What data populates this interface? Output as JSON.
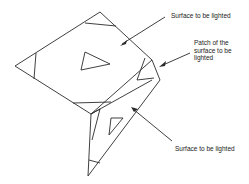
{
  "diagram": {
    "labels": {
      "surface_top": "Surface to be lighted",
      "patch_line1": "Patch of the",
      "patch_line2": "surface to be",
      "patch_line3": "lighted",
      "surface_bottom": "Surface to be lighted"
    },
    "colors": {
      "line": "#2a2a2a",
      "background": "#ffffff",
      "text": "#222222"
    }
  }
}
